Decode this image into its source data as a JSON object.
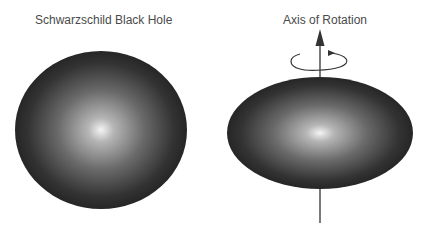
{
  "panels": [
    {
      "title": "Schwarzschild Black Hole",
      "shape": "sphere"
    },
    {
      "title": "Axis of Rotation",
      "shape": "oblate-spheroid"
    }
  ],
  "colors": {
    "dark": "#262626",
    "highlight": "#f2f2f2",
    "text": "#4a4a4a",
    "axis": "#333333"
  }
}
